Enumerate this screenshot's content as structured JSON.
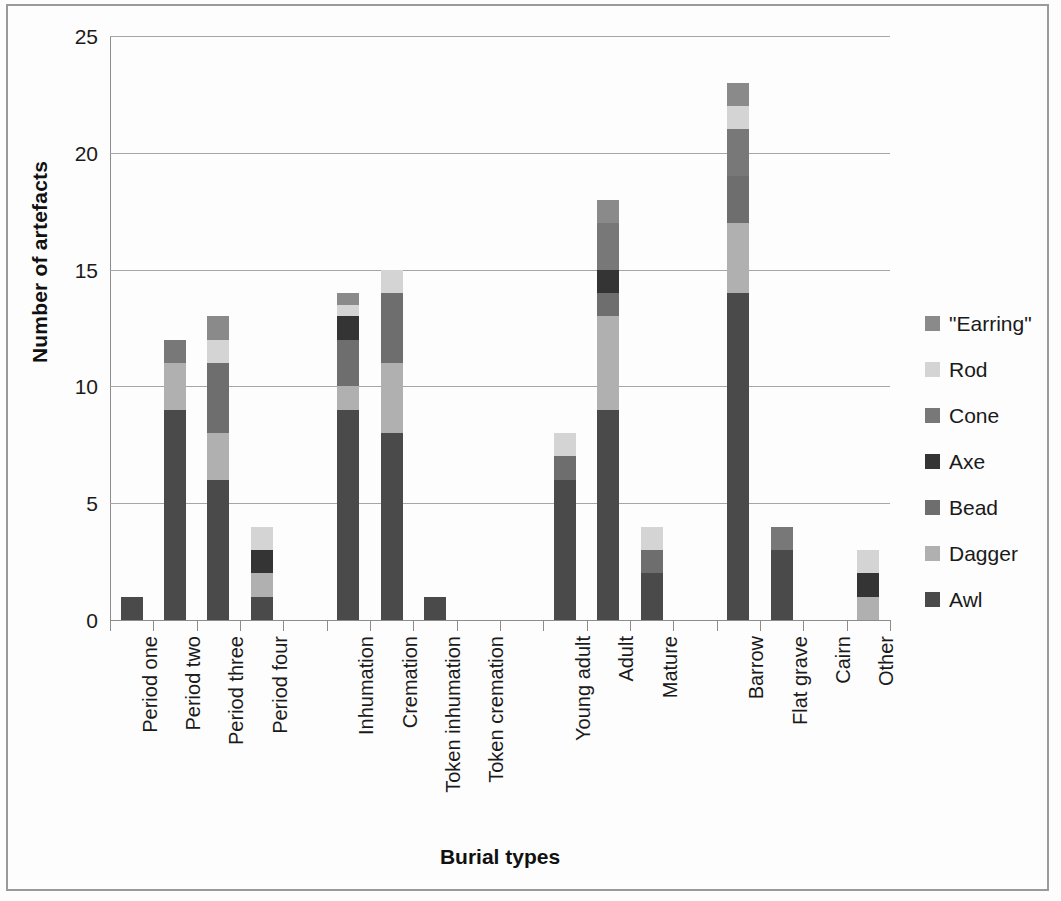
{
  "page": {
    "background": "#fdfdfd",
    "border_color": "#9a9a9a"
  },
  "chart_data": {
    "type": "bar",
    "subtype": "stacked-bar",
    "title": "",
    "xlabel": "Burial types",
    "ylabel": "Number of artefacts",
    "ylim": [
      0,
      25
    ],
    "yticks": [
      0,
      5,
      10,
      15,
      20,
      25
    ],
    "ytick_labels": [
      "0",
      "5",
      "10",
      "15",
      "20",
      "25"
    ],
    "grid": "horizontal",
    "legend_position": "right",
    "categories": [
      "Period one",
      "Period two",
      "Period three",
      "Period four",
      "",
      "Inhumation",
      "Cremation",
      "Token inhumation",
      "Token cremation",
      "",
      "Young adult",
      "Adult",
      "Mature",
      "",
      "Barrow",
      "Flat grave",
      "Cairn",
      "Other"
    ],
    "series": [
      {
        "name": "Awl",
        "color": "#4a4a4a",
        "values": [
          1,
          9,
          6,
          1,
          0,
          9,
          8,
          1,
          0,
          0,
          6,
          9,
          2,
          0,
          14,
          3,
          0,
          0
        ]
      },
      {
        "name": "Dagger",
        "color": "#b0b0b0",
        "values": [
          0,
          2,
          2,
          1,
          0,
          1,
          3,
          0,
          0,
          0,
          0,
          4,
          0,
          0,
          3,
          0,
          0,
          1
        ]
      },
      {
        "name": "Bead",
        "color": "#6e6e6e",
        "values": [
          0,
          0,
          3,
          0,
          0,
          2,
          3,
          0,
          0,
          0,
          1,
          1,
          1,
          0,
          2,
          0,
          0,
          0
        ]
      },
      {
        "name": "Axe",
        "color": "#343434",
        "values": [
          0,
          0,
          0,
          1,
          0,
          1,
          0,
          0,
          0,
          0,
          0,
          1,
          0,
          0,
          0,
          0,
          0,
          1
        ]
      },
      {
        "name": "Cone",
        "color": "#787878",
        "values": [
          0,
          1,
          0,
          0,
          0,
          0,
          0,
          0,
          0,
          0,
          0,
          2,
          0,
          0,
          2,
          1,
          0,
          0
        ]
      },
      {
        "name": "Rod",
        "color": "#d4d4d4",
        "values": [
          0,
          0,
          1,
          1,
          0,
          0.5,
          1,
          0,
          0,
          0,
          1,
          0,
          1,
          0,
          1,
          0,
          0,
          1
        ]
      },
      {
        "name": "\"Earring\"",
        "color": "#8a8a8a",
        "values": [
          0,
          0,
          1,
          0,
          0,
          0.5,
          0,
          0,
          0,
          0,
          0,
          1,
          0,
          0,
          1,
          0,
          0,
          0
        ]
      }
    ],
    "totals": [
      1,
      12,
      13,
      4,
      0,
      14,
      15,
      1,
      0,
      0,
      8,
      18,
      4,
      0,
      23,
      4,
      0,
      3
    ]
  },
  "legend": {
    "items": [
      {
        "label": "\"Earring\"",
        "color": "#8a8a8a"
      },
      {
        "label": "Rod",
        "color": "#d4d4d4"
      },
      {
        "label": "Cone",
        "color": "#787878"
      },
      {
        "label": "Axe",
        "color": "#343434"
      },
      {
        "label": "Bead",
        "color": "#6e6e6e"
      },
      {
        "label": "Dagger",
        "color": "#b0b0b0"
      },
      {
        "label": "Awl",
        "color": "#4a4a4a"
      }
    ]
  }
}
